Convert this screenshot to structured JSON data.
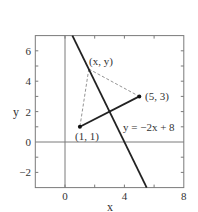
{
  "diagram": {
    "type": "coordinate-geometry",
    "xlabel": "x",
    "ylabel": "y",
    "xlim": [
      -2,
      8
    ],
    "ylim": [
      -3,
      7
    ],
    "x_ticks": [
      {
        "value": 0,
        "label": "0"
      },
      {
        "value": 4,
        "label": "4"
      },
      {
        "value": 8,
        "label": "8"
      }
    ],
    "x_minor_ticks": [
      2,
      6
    ],
    "y_ticks": [
      {
        "value": -2,
        "label": "−2"
      },
      {
        "value": 0,
        "label": "0"
      },
      {
        "value": 2,
        "label": "2"
      },
      {
        "value": 4,
        "label": "4"
      },
      {
        "value": 6,
        "label": "6"
      }
    ],
    "y_minor_ticks": [
      -1,
      1,
      3,
      5
    ],
    "line": {
      "equation": "y = −2x + 8",
      "slope": -2,
      "intercept": 8,
      "color": "#222222"
    },
    "points": {
      "a": {
        "label": "(1, 1)",
        "x": 1,
        "y": 1
      },
      "b": {
        "label": "(5, 3)",
        "x": 5,
        "y": 3
      },
      "p": {
        "label": "(x, y)",
        "x": 1.6,
        "y": 4.8
      }
    },
    "segment": {
      "from": "a",
      "to": "b",
      "color": "#222222"
    },
    "dashed_segments": [
      {
        "from": "p",
        "to": "a"
      },
      {
        "from": "p",
        "to": "b"
      }
    ],
    "colors": {
      "frame": "#7a7a7a",
      "axes": "#7a7a7a",
      "dashed": "#888888",
      "text": "#333333"
    }
  }
}
